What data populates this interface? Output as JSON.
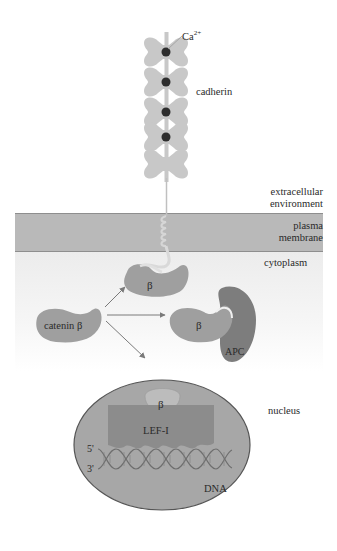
{
  "diagram": {
    "colors": {
      "protein_light": "#c8c8c8",
      "protein_medium": "#9f9f9f",
      "protein_dark": "#7d7d7d",
      "calcium": "#2e2e2e",
      "membrane": "#b9b9b9",
      "nucleus": "#a7a7a7",
      "dna_strand": "#6e6e6e",
      "arrow": "#7a7a7a"
    },
    "labels": {
      "calcium": "Ca",
      "calcium_charge": "2+",
      "cadherin": "cadherin",
      "extracellular_line1": "extracellular",
      "extracellular_line2": "environment",
      "membrane_line1": "plasma",
      "membrane_line2": "membrane",
      "cytoplasm": "cytoplasm",
      "catenin": "catenin β",
      "beta_membrane": "β",
      "beta_apc": "β",
      "apc": "APC",
      "nucleus": "nucleus",
      "beta_nucleus": "β",
      "lef": "LEF-I",
      "five_prime": "5'",
      "three_prime": "3'",
      "dna": "DNA"
    },
    "cadherin_domains": 5,
    "calcium_ions": 4,
    "arrows": [
      {
        "from": "catenin-beta",
        "to": "membrane-bound-beta"
      },
      {
        "from": "catenin-beta",
        "to": "apc-bound-beta"
      },
      {
        "from": "catenin-beta",
        "to": "nucleus"
      }
    ]
  }
}
